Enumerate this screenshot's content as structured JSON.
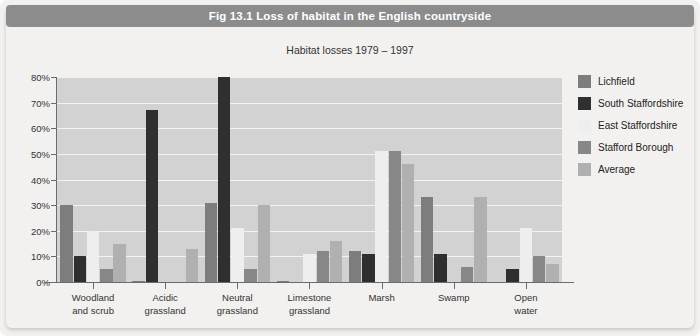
{
  "figure": {
    "title": "Fig 13.1  Loss of habitat in the English countryside",
    "title_bar_color": "#8c8c8c"
  },
  "chart_data": {
    "type": "bar",
    "title": "Habitat losses 1979 – 1997",
    "xlabel": "",
    "ylabel": "",
    "ylim": [
      0,
      80
    ],
    "grid": true,
    "legend_position": "right",
    "categories": [
      "Woodland\nand scrub",
      "Acidic\ngrassland",
      "Neutral\ngrassland",
      "Limestone\ngrassland",
      "Marsh",
      "Swamp",
      "Open\nwater"
    ],
    "category_lines": [
      [
        "Woodland",
        "and scrub"
      ],
      [
        "Acidic",
        "grassland"
      ],
      [
        "Neutral",
        "grassland"
      ],
      [
        "Limestone",
        "grassland"
      ],
      [
        "Marsh",
        ""
      ],
      [
        "Swamp",
        ""
      ],
      [
        "Open",
        "water"
      ]
    ],
    "ticks": [
      "0%",
      "10%",
      "20%",
      "30%",
      "40%",
      "50%",
      "60%",
      "70%",
      "80%"
    ],
    "tick_values": [
      0,
      10,
      20,
      30,
      40,
      50,
      60,
      70,
      80
    ],
    "series": [
      {
        "name": "Lichfield",
        "color": "#7d7d7d",
        "values": [
          30,
          0.5,
          31,
          0.5,
          12,
          33,
          0
        ]
      },
      {
        "name": "South Staffordshire",
        "color": "#2f2f2f",
        "values": [
          10,
          67,
          80,
          0,
          11,
          11,
          5
        ]
      },
      {
        "name": "East Staffordshire",
        "color": "#eeeeee",
        "values": [
          20,
          0,
          21,
          11,
          51,
          0,
          21
        ]
      },
      {
        "name": "Stafford Borough",
        "color": "#878787",
        "values": [
          5,
          0,
          5,
          12,
          51,
          6,
          10
        ]
      },
      {
        "name": "Average",
        "color": "#b0b0b0",
        "values": [
          15,
          13,
          30,
          16,
          46,
          33,
          7
        ]
      }
    ]
  }
}
